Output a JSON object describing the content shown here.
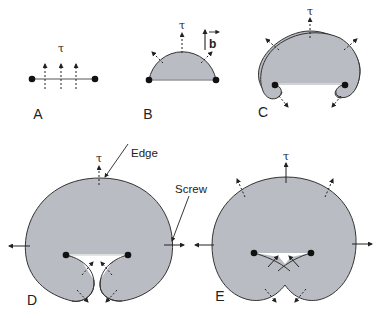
{
  "figure": {
    "panels": [
      {
        "id": "A",
        "label": "A",
        "tau": "τ"
      },
      {
        "id": "B",
        "label": "B",
        "tau": "τ",
        "burgers": "b"
      },
      {
        "id": "C",
        "label": "C",
        "tau": "τ"
      },
      {
        "id": "D",
        "label": "D",
        "tau": "τ",
        "annotations": [
          "Edge",
          "Screw"
        ]
      },
      {
        "id": "E",
        "label": "E",
        "tau": "τ"
      }
    ],
    "colors": {
      "loop_fill": "#b9bcc2",
      "stroke": "#222222",
      "background": "#ffffff"
    }
  }
}
